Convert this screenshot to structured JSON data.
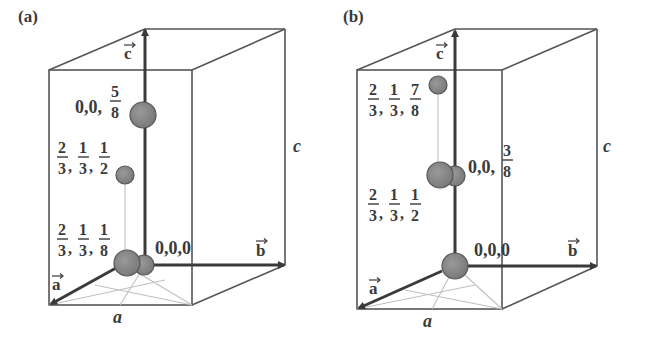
{
  "figure": {
    "panels": [
      {
        "id": "a",
        "label": "(a)",
        "axes": {
          "a": "a",
          "b": "b",
          "c": "c",
          "edge_a": "a",
          "edge_c": "c"
        },
        "atoms": [
          {
            "position": "0,0,5/8",
            "whole": "0,0,",
            "frac_num": "5",
            "frac_den": "8"
          },
          {
            "position": "2/3,1/3,1/2",
            "fracs": [
              [
                "2",
                "3"
              ],
              [
                "1",
                "3"
              ],
              [
                "1",
                "2"
              ]
            ]
          },
          {
            "position": "2/3,1/3,1/8",
            "fracs": [
              [
                "2",
                "3"
              ],
              [
                "1",
                "3"
              ],
              [
                "1",
                "8"
              ]
            ]
          },
          {
            "position": "0,0,0",
            "text": "0,0,0"
          }
        ]
      },
      {
        "id": "b",
        "label": "(b)",
        "axes": {
          "a": "a",
          "b": "b",
          "c": "c",
          "edge_a": "a",
          "edge_c": "c"
        },
        "atoms": [
          {
            "position": "2/3,1/3,7/8",
            "fracs": [
              [
                "2",
                "3"
              ],
              [
                "1",
                "3"
              ],
              [
                "7",
                "8"
              ]
            ]
          },
          {
            "position": "0,0,3/8",
            "whole": "0,0,",
            "frac_num": "3",
            "frac_den": "8"
          },
          {
            "position": "2/3,1/3,1/2",
            "fracs": [
              [
                "2",
                "3"
              ],
              [
                "1",
                "3"
              ],
              [
                "1",
                "2"
              ]
            ]
          },
          {
            "position": "0,0,0",
            "text": "0,0,0"
          }
        ]
      }
    ],
    "colors": {
      "line": "#4a4a4a",
      "atom": "#8a8a8a",
      "atom_stroke": "#555555",
      "guide": "#bdbdbd"
    }
  }
}
